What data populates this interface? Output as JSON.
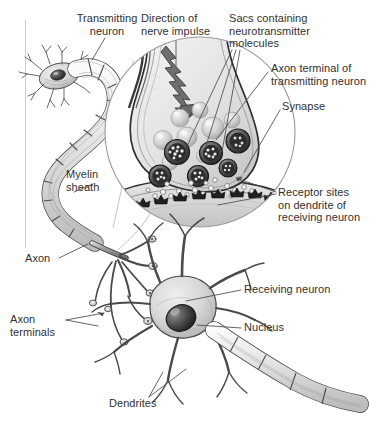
{
  "figure": {
    "domain": "biology-diagram",
    "style": "pencil-shaded scientific illustration, grayscale",
    "background_color": "#ffffff",
    "text_color": "#333032",
    "frame": {
      "left_rule_color": "#cfcfcf",
      "left_rule_x": 25,
      "left_rule_top": 20,
      "left_rule_bottom": 248
    }
  },
  "labels": [
    {
      "id": "transmitting-neuron",
      "text": "Transmitting\nneuron",
      "x": 62,
      "y": 12,
      "align": "center",
      "width": 90,
      "leader": [
        [
          107,
          38
        ],
        [
          92,
          58
        ]
      ]
    },
    {
      "id": "direction-of-nerve-impulse",
      "text": "Direction of\nnerve impulse",
      "x": 140,
      "y": 12,
      "align": "left",
      "width": 84,
      "leader": [
        [
          176,
          40
        ],
        [
          176,
          66
        ]
      ]
    },
    {
      "id": "sacs-containing-neurotransmitter-molecules",
      "text": "Sacs containing\nneurotransmitter\nmolecules",
      "x": 229,
      "y": 12,
      "align": "left",
      "width": 100,
      "leader": [
        [
          232,
          50
        ],
        [
          185,
          150
        ]
      ]
    },
    {
      "id": "axon-terminal-of-transmitting-neuron",
      "text": "Axon terminal of\ntransmitting neuron",
      "x": 271,
      "y": 62,
      "align": "left",
      "width": 108,
      "leader": [
        [
          268,
          70
        ],
        [
          215,
          140
        ]
      ]
    },
    {
      "id": "synapse",
      "text": "Synapse",
      "x": 282,
      "y": 100,
      "align": "left",
      "width": 56,
      "leader": [
        [
          280,
          108
        ],
        [
          243,
          172
        ]
      ]
    },
    {
      "id": "receptor-sites-on-dendrite-of-receiving-neuron",
      "text": "Receptor sites\non dendrite of\nreceiving neuron",
      "x": 278,
      "y": 186,
      "align": "left",
      "width": 100,
      "leader": [
        [
          276,
          192
        ],
        [
          232,
          178
        ]
      ]
    },
    {
      "id": "myelin-sheath",
      "text": "Myelin\nsheath",
      "x": 66,
      "y": 168,
      "align": "left",
      "width": 52,
      "leader": [
        [
          66,
          184
        ],
        [
          48,
          192
        ]
      ]
    },
    {
      "id": "axon",
      "text": "Axon",
      "x": 26,
      "y": 255,
      "align": "left",
      "width": 34,
      "leader": [
        [
          58,
          258
        ],
        [
          88,
          243
        ]
      ]
    },
    {
      "id": "axon-terminals",
      "text": "Axon\nterminals",
      "x": 10,
      "y": 316,
      "align": "left",
      "width": 60,
      "leader": [
        [
          63,
          320
        ],
        [
          103,
          312
        ]
      ]
    },
    {
      "id": "receiving-neuron",
      "text": "Receiving neuron",
      "x": 243,
      "y": 284,
      "align": "left",
      "width": 96,
      "leader": [
        [
          241,
          290
        ],
        [
          188,
          300
        ]
      ]
    },
    {
      "id": "nucleus",
      "text": "Nucleus",
      "x": 243,
      "y": 322,
      "align": "left",
      "width": 52,
      "leader": [
        [
          241,
          328
        ],
        [
          196,
          326
        ]
      ]
    },
    {
      "id": "dendrites",
      "text": "Dendrites",
      "x": 109,
      "y": 399,
      "align": "left",
      "width": 60,
      "leader": [
        [
          150,
          398
        ],
        [
          185,
          372
        ]
      ]
    }
  ],
  "structures": {
    "transmitting_neuron": {
      "name": "Transmitting neuron cell body with dendrites",
      "nucleus_present": true
    },
    "myelinated_axon": {
      "name": "Myelinated axon",
      "segment_count": 9
    },
    "magnifier": {
      "name": "Magnified synapse circle",
      "center_x": 200,
      "center_y": 132,
      "radius": 95,
      "contents": [
        "axon terminal bulb",
        "lightning-bolt impulse arrow",
        "synaptic vesicles (sacs)",
        "neurotransmitter molecules",
        "synaptic cleft",
        "receptor sites on dendrite"
      ],
      "vesicle_count": 14,
      "receptor_count": 9
    },
    "receiving_neuron": {
      "name": "Receiving neuron",
      "nucleus_present": true,
      "dendrite_count": 8
    }
  }
}
